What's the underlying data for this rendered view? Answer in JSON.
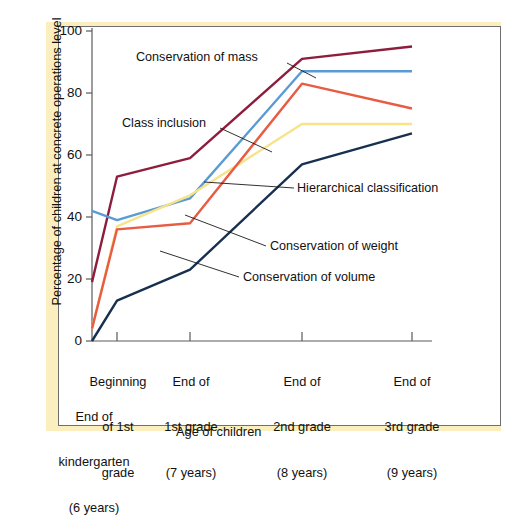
{
  "figure": {
    "background_color": "#ffffff",
    "mat_color": "#fbefc0",
    "card_border_color": "#6f6f6f",
    "axis_color": "#5a5a5a"
  },
  "chart_data": {
    "type": "line",
    "title": "",
    "xlabel": "Age of children",
    "ylabel": "Percentage of children at concrete operations level",
    "categories": [
      "End of\nkindergarten\n(6 years)",
      "Beginning\nof 1st\ngrade",
      "End of\n1st grade\n(7 years)",
      "End of\n2nd grade\n(8 years)",
      "End of\n3rd grade\n(9 years)"
    ],
    "category_lines": [
      [
        "End of",
        "kindergarten",
        "(6 years)"
      ],
      [
        "Beginning",
        "of 1st",
        "grade"
      ],
      [
        "End of",
        "1st grade",
        "(7 years)"
      ],
      [
        "End of",
        "2nd grade",
        "(8 years)"
      ],
      [
        "End of",
        "3rd grade",
        "(9 years)"
      ]
    ],
    "ylim": [
      0,
      100
    ],
    "yticks": [
      0,
      20,
      40,
      60,
      80,
      100
    ],
    "ytick_labels": [
      "0",
      "20",
      "40",
      "60",
      "80",
      "100"
    ],
    "grid": false,
    "legend_position": "inline-annotations",
    "series": [
      {
        "name": "Conservation of mass",
        "color": "#8e1d3d",
        "values": [
          19,
          53,
          59,
          91,
          95
        ]
      },
      {
        "name": "Class inclusion",
        "color": "#5b9bd5",
        "values": [
          42,
          39,
          46,
          87,
          87
        ]
      },
      {
        "name": "Hierarchical classification",
        "color": "#f7e389",
        "values": [
          4,
          37,
          47,
          70,
          70
        ]
      },
      {
        "name": "Conservation of weight",
        "color": "#e85c43",
        "values": [
          4,
          36,
          38,
          83,
          75
        ]
      },
      {
        "name": "Conservation of volume",
        "color": "#17304f",
        "values": [
          0,
          13,
          23,
          57,
          67
        ]
      }
    ],
    "annotations": [
      {
        "text": "Conservation of mass",
        "series": "Conservation of mass"
      },
      {
        "text": "Class inclusion",
        "series": "Class inclusion"
      },
      {
        "text": "Hierarchical classification",
        "series": "Hierarchical classification"
      },
      {
        "text": "Conservation of weight",
        "series": "Conservation of weight"
      },
      {
        "text": "Conservation of volume",
        "series": "Conservation of volume"
      }
    ]
  }
}
